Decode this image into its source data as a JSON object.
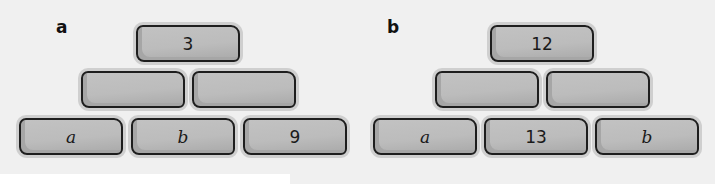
{
  "pyramids": [
    {
      "label": "a",
      "top": {
        "value": "3",
        "italic": false
      },
      "middle": [
        {
          "value": "",
          "italic": false
        },
        {
          "value": "",
          "italic": false
        }
      ],
      "bottom": [
        {
          "value": "a",
          "italic": true
        },
        {
          "value": "b",
          "italic": true
        },
        {
          "value": "9",
          "italic": false
        }
      ]
    },
    {
      "label": "b",
      "top": {
        "value": "12",
        "italic": false
      },
      "middle": [
        {
          "value": "",
          "italic": false
        },
        {
          "value": "",
          "italic": false
        }
      ],
      "bottom": [
        {
          "value": "a",
          "italic": true
        },
        {
          "value": "13",
          "italic": false
        },
        {
          "value": "b",
          "italic": true
        }
      ]
    }
  ]
}
